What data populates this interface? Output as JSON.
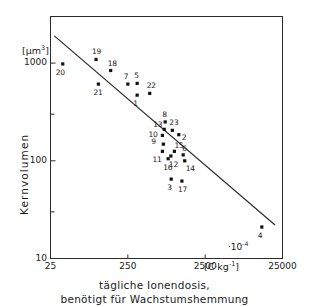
{
  "chart_data": {
    "type": "scatter",
    "title": "",
    "caption_lines": [
      "tägliche Ionendosis,",
      "benötigt für Wachstumshemmung"
    ],
    "xlabel": "tägliche Ionendosis, benötigt für Wachstumshemmung",
    "ylabel": "Kernvolumen",
    "x_unit": "[C·kg⁻¹]",
    "y_unit": "[µm³]",
    "x_multiplier": "·10⁻⁴",
    "xscale": "log",
    "yscale": "log",
    "xlim": [
      25,
      25000
    ],
    "ylim": [
      10,
      3000
    ],
    "xticks": [
      25,
      250,
      2500,
      25000
    ],
    "xtick_labels": [
      "25",
      "250",
      "2500",
      "25000"
    ],
    "yticks": [
      10,
      100,
      1000
    ],
    "ytick_labels": [
      "10",
      "100",
      "1000"
    ],
    "y_minor_ticks": [
      30,
      300,
      3000
    ],
    "grid": false,
    "legend": "none",
    "points": [
      {
        "label": "20",
        "x": 36,
        "y": 980,
        "lx": -4,
        "ly": 9
      },
      {
        "label": "19",
        "x": 97,
        "y": 1090,
        "lx": -1,
        "ly": -7
      },
      {
        "label": "18",
        "x": 150,
        "y": 840,
        "lx": 0,
        "ly": -7
      },
      {
        "label": "21",
        "x": 104,
        "y": 610,
        "lx": -2,
        "ly": 9
      },
      {
        "label": "7",
        "x": 250,
        "y": 610,
        "lx": -1,
        "ly": -7
      },
      {
        "label": "5",
        "x": 330,
        "y": 620,
        "lx": 0,
        "ly": -7
      },
      {
        "label": "1",
        "x": 330,
        "y": 470,
        "lx": -1,
        "ly": 9
      },
      {
        "label": "22",
        "x": 480,
        "y": 490,
        "lx": 0,
        "ly": -7
      },
      {
        "label": "8",
        "x": 760,
        "y": 250,
        "lx": 0,
        "ly": -7
      },
      {
        "label": "13",
        "x": 740,
        "y": 210,
        "lx": -8,
        "ly": -4
      },
      {
        "label": "23",
        "x": 940,
        "y": 205,
        "lx": 0,
        "ly": -7
      },
      {
        "label": "2",
        "x": 1140,
        "y": 185,
        "lx": 6,
        "ly": 3
      },
      {
        "label": "10",
        "x": 700,
        "y": 182,
        "lx": -11,
        "ly": 0
      },
      {
        "label": "9",
        "x": 720,
        "y": 148,
        "lx": -9,
        "ly": -2
      },
      {
        "label": "11",
        "x": 700,
        "y": 125,
        "lx": -7,
        "ly": 9
      },
      {
        "label": "15",
        "x": 1000,
        "y": 125,
        "lx": 3,
        "ly": -5
      },
      {
        "label": "12",
        "x": 900,
        "y": 112,
        "lx": 1,
        "ly": 9
      },
      {
        "label": "16",
        "x": 830,
        "y": 105,
        "lx": -2,
        "ly": 9
      },
      {
        "label": "6",
        "x": 1300,
        "y": 115,
        "lx": 2,
        "ly": -6
      },
      {
        "label": "14",
        "x": 1360,
        "y": 100,
        "lx": 4,
        "ly": 8
      },
      {
        "label": "3",
        "x": 910,
        "y": 65,
        "lx": -1,
        "ly": 9
      },
      {
        "label": "17",
        "x": 1250,
        "y": 62,
        "lx": -1,
        "ly": 9
      },
      {
        "label": "4",
        "x": 13500,
        "y": 21,
        "lx": -1,
        "ly": 9
      }
    ],
    "trendline": {
      "description": "regression line, log-log",
      "x_start": 28,
      "y_start": 1900,
      "x_end": 20000,
      "y_end": 22
    }
  }
}
